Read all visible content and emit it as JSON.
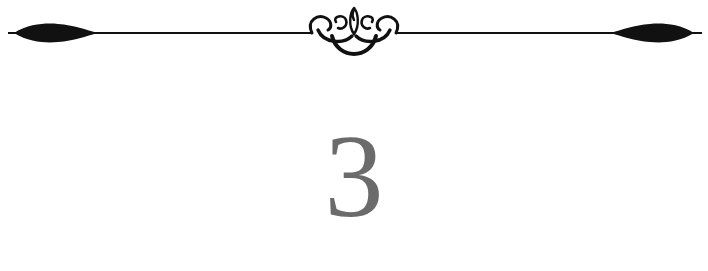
{
  "chapter": {
    "number": "3"
  },
  "ornament": {
    "type": "decorative-divider",
    "color": "#111111"
  },
  "colors": {
    "background": "#ffffff",
    "numeral": "#6b6b6b",
    "ornament": "#111111"
  }
}
